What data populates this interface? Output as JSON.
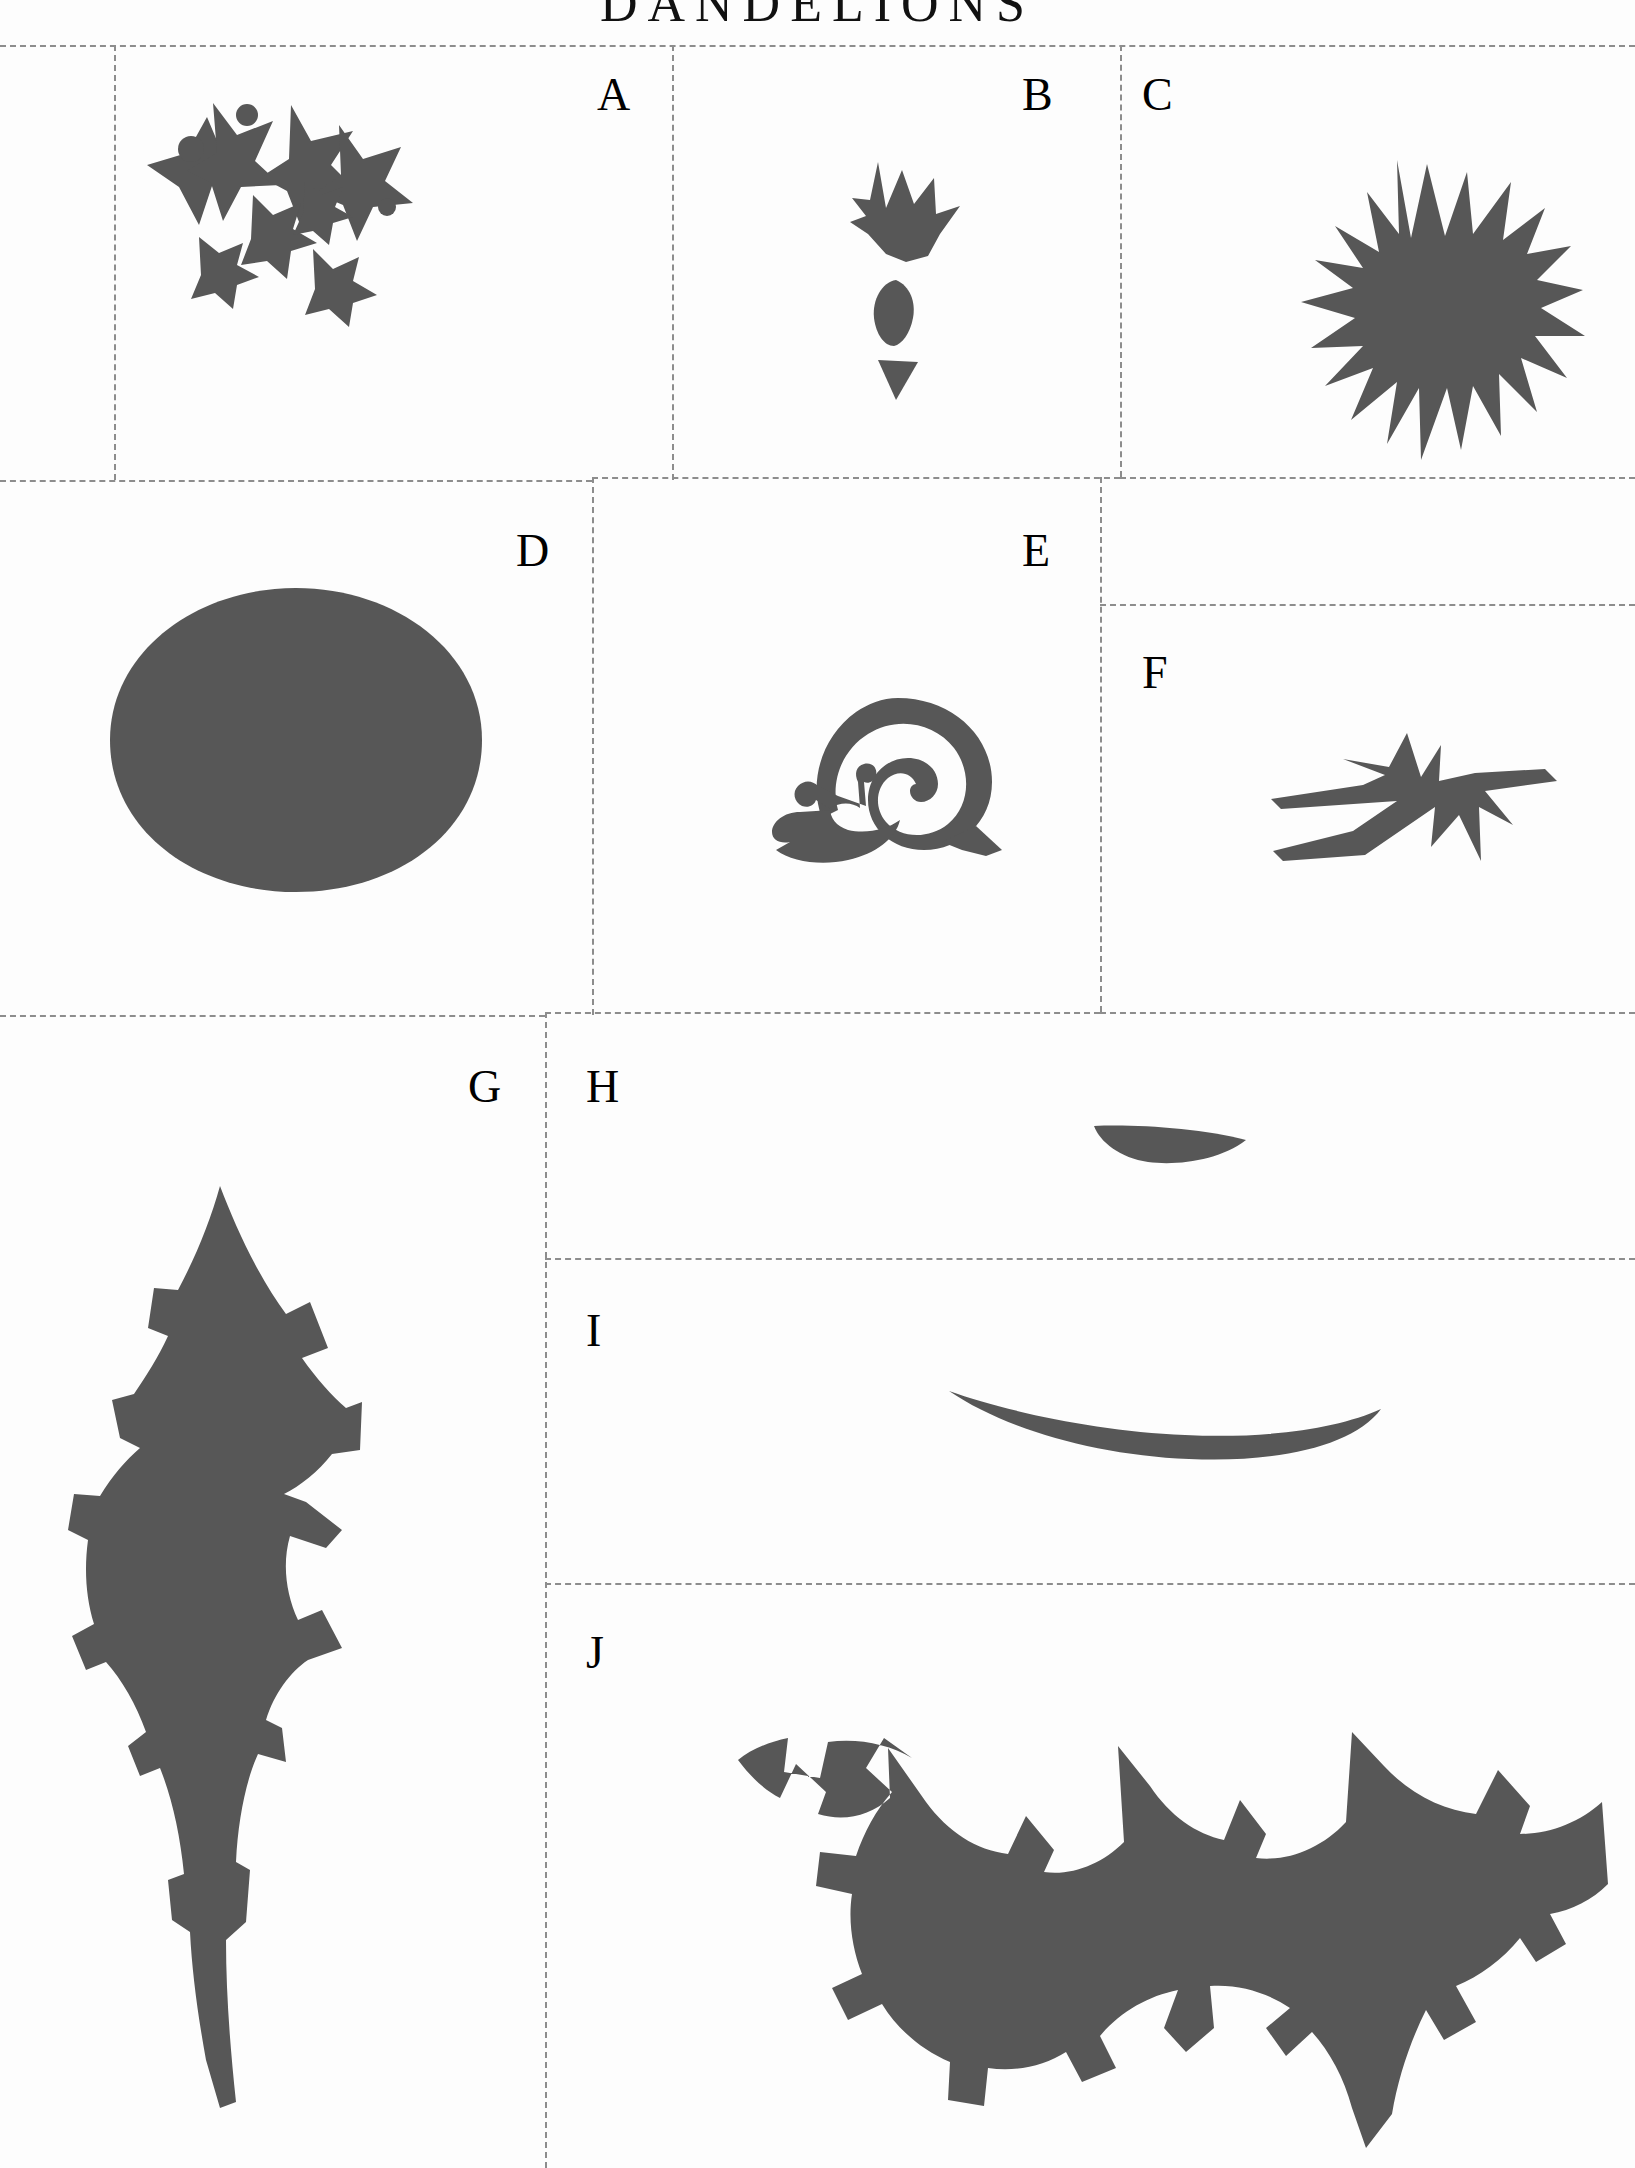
{
  "document": {
    "title": "DANDELIONS",
    "sheet_type": "craft template / cut-out pattern sheet",
    "background_color": "#fdfdfd",
    "ink_color": "#575757",
    "rule_color": "#8d8d8d"
  },
  "cells": [
    {
      "id": "A",
      "label": "A",
      "content": "scattered star-shaped petals and small round dots (dandelion seed florets)",
      "label_x": 597,
      "label_y": 72,
      "row": 1
    },
    {
      "id": "B",
      "label": "B",
      "content": "small crown-shaped flower bud with oval and triangular sepal pieces",
      "label_x": 1022,
      "label_y": 72,
      "row": 1
    },
    {
      "id": "C",
      "label": "C",
      "content": "spiky sunburst dandelion flower head",
      "label_x": 1142,
      "label_y": 72,
      "row": 1
    },
    {
      "id": "D",
      "label": "D",
      "content": "solid filled oval disc",
      "label_x": 516,
      "label_y": 528,
      "row": 2
    },
    {
      "id": "E",
      "label": "E",
      "content": "snail with spiral shell and antennae",
      "label_x": 1022,
      "label_y": 528,
      "row": 2
    },
    {
      "id": "F",
      "label": "F",
      "content": "spiky star bract with long trailing arms",
      "label_x": 1142,
      "label_y": 650,
      "row": 2
    },
    {
      "id": "G",
      "label": "G",
      "content": "long serrated dandelion leaf, vertical",
      "label_x": 468,
      "label_y": 1064,
      "row": 3
    },
    {
      "id": "H",
      "label": "H",
      "content": "small shallow crescent arc",
      "label_x": 586,
      "label_y": 1064,
      "row": 3
    },
    {
      "id": "I",
      "label": "I",
      "content": "long curved crescent blade",
      "label_x": 586,
      "label_y": 1308,
      "row": 3
    },
    {
      "id": "J",
      "label": "J",
      "content": "large deeply lobed dandelion leaf, horizontal",
      "label_x": 586,
      "label_y": 1630,
      "row": 3
    }
  ],
  "grid": {
    "horizontal_rules": [
      {
        "name": "rule-top",
        "x": 0,
        "y": 45,
        "width": 1635
      },
      {
        "name": "rule-row1-row2-left",
        "x": 0,
        "y": 480,
        "width": 592
      },
      {
        "name": "rule-row1-row2-mid",
        "x": 592,
        "y": 477,
        "width": 528
      },
      {
        "name": "rule-bc-divider",
        "x": 1120,
        "y": 477,
        "width": 515
      },
      {
        "name": "rule-ef-divider",
        "x": 1100,
        "y": 604,
        "width": 535
      },
      {
        "name": "rule-row2-row3-left",
        "x": 0,
        "y": 1015,
        "width": 545
      },
      {
        "name": "rule-row2-row3-right",
        "x": 545,
        "y": 1012,
        "width": 555
      },
      {
        "name": "rule-f-bottom",
        "x": 1100,
        "y": 1012,
        "width": 535
      },
      {
        "name": "rule-h-i",
        "x": 545,
        "y": 1258,
        "width": 1090
      },
      {
        "name": "rule-i-j",
        "x": 545,
        "y": 1583,
        "width": 1090
      }
    ],
    "vertical_rules": [
      {
        "name": "rule-a-b",
        "x": 672,
        "y": 45,
        "height": 435
      },
      {
        "name": "rule-b-c",
        "x": 1120,
        "y": 45,
        "height": 432
      },
      {
        "name": "rule-d-e",
        "x": 592,
        "y": 477,
        "height": 538
      },
      {
        "name": "rule-e-f",
        "x": 1100,
        "y": 477,
        "height": 535
      },
      {
        "name": "rule-g-right",
        "x": 545,
        "y": 1012,
        "height": 1156
      },
      {
        "name": "rule-sheet-left",
        "x": 114,
        "y": 45,
        "height": 435
      }
    ]
  }
}
